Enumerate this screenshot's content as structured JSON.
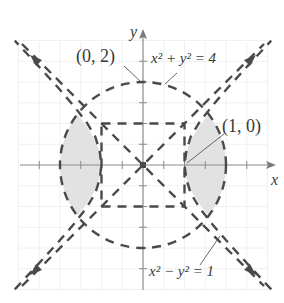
{
  "figure": {
    "type": "graph",
    "axes": {
      "x_label": "x",
      "y_label": "y",
      "tick_step": 0.5,
      "x_range": [
        -3,
        3
      ],
      "y_range": [
        -3,
        3
      ]
    },
    "labels": {
      "point_top": "(0, 2)",
      "point_right": "(1, 0)",
      "circle_eq_base": "x",
      "circle_eq": "x² + y² = 4",
      "hyperbola_eq": "x² − y² = 1"
    },
    "curves": [
      {
        "name": "circle",
        "equation": "x^2 + y^2 = 4",
        "style": "dashed"
      },
      {
        "name": "hyperbola",
        "equation": "x^2 - y^2 = 1",
        "style": "dashed"
      },
      {
        "name": "asymptote-positive",
        "equation": "y = x",
        "style": "dashed"
      },
      {
        "name": "asymptote-negative",
        "equation": "y = -x",
        "style": "dashed"
      },
      {
        "name": "square",
        "equation": "|x| = 1, |y| = 1",
        "style": "dashed"
      }
    ],
    "shaded_region": "2 lens regions between hyperbola branches and circle",
    "colors": {
      "curve": "#4a4a4a",
      "axis": "#8a8a8a",
      "grid": "#ececec",
      "shade": "#e2e2e2",
      "text": "#3a3a3a"
    }
  }
}
